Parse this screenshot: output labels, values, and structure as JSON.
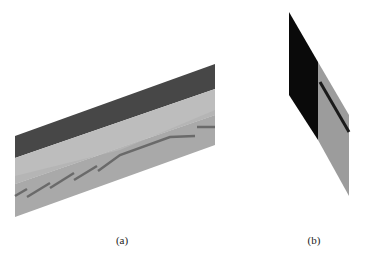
{
  "figure": {
    "panels": [
      {
        "id": "a",
        "caption": "(a)",
        "description": "Oblique view of layered strata with stepped fault line"
      },
      {
        "id": "b",
        "caption": "(b)",
        "description": "Side view of layered block with dark top layer and dark fault line"
      }
    ],
    "colors": {
      "dark_layer": "#474747",
      "light_layer": "#bdbdbd",
      "medium_layer": "#a9a9a9",
      "fault_line": "#6a6a6a",
      "black_layer": "#0a0a0a",
      "gray_layer": "#9c9c9c"
    }
  }
}
